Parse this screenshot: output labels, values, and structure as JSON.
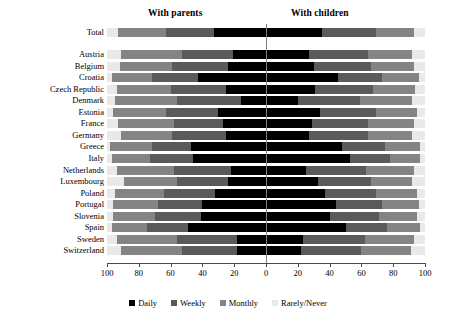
{
  "headers": {
    "left": "With parents",
    "right": "With children"
  },
  "legend": {
    "items": [
      {
        "label": "Daily",
        "color": "#000000"
      },
      {
        "label": "Weekly",
        "color": "#5a5a5a"
      },
      {
        "label": "Monthly",
        "color": "#848484"
      },
      {
        "label": "Rarely/Never",
        "color": "#e9e9e9"
      }
    ]
  },
  "axis": {
    "ticks": [
      "100",
      "80",
      "60",
      "40",
      "20",
      "0",
      "20",
      "40",
      "60",
      "80",
      "100"
    ],
    "tick_values": [
      -100,
      -80,
      -60,
      -40,
      -20,
      0,
      20,
      40,
      60,
      80,
      100
    ],
    "min": -100,
    "max": 100
  },
  "chart_data": {
    "type": "bar",
    "orientation": "horizontal",
    "style": "diverging-stacked",
    "title": "",
    "subtitle": "",
    "xlabel": "",
    "ylabel": "",
    "xlim": [
      -100,
      100
    ],
    "grid": false,
    "legend_position": "bottom",
    "panel_left_label": "With parents",
    "panel_right_label": "With children",
    "series_names": [
      "Daily",
      "Weekly",
      "Monthly",
      "Rarely/Never"
    ],
    "series_colors": [
      "#000000",
      "#5a5a5a",
      "#848484",
      "#e9e9e9"
    ],
    "categories": [
      "Total",
      "Austria",
      "Belgium",
      "Croatia",
      "Czech Republic",
      "Denmark",
      "Estonia",
      "France",
      "Germany",
      "Greece",
      "Italy",
      "Netherlands",
      "Luxembourg",
      "Poland",
      "Portugal",
      "Slovenia",
      "Spain",
      "Sweden",
      "Switzerland"
    ],
    "note": "Values are percentages. Left side = contact with parents, right side = contact with children. Each side sums to 100.",
    "left_values": [
      {
        "category": "Total",
        "Daily": 33,
        "Weekly": 30,
        "Monthly": 30,
        "RarelyNever": 7
      },
      {
        "category": "Austria",
        "Daily": 21,
        "Weekly": 32,
        "Monthly": 38,
        "RarelyNever": 9
      },
      {
        "category": "Belgium",
        "Daily": 24,
        "Weekly": 35,
        "Monthly": 33,
        "RarelyNever": 8
      },
      {
        "category": "Croatia",
        "Daily": 43,
        "Weekly": 29,
        "Monthly": 25,
        "RarelyNever": 3
      },
      {
        "category": "Czech Republic",
        "Daily": 25,
        "Weekly": 35,
        "Monthly": 34,
        "RarelyNever": 6
      },
      {
        "category": "Denmark",
        "Daily": 16,
        "Weekly": 40,
        "Monthly": 39,
        "RarelyNever": 5
      },
      {
        "category": "Estonia",
        "Daily": 30,
        "Weekly": 33,
        "Monthly": 33,
        "RarelyNever": 4
      },
      {
        "category": "France",
        "Daily": 27,
        "Weekly": 31,
        "Monthly": 35,
        "RarelyNever": 7
      },
      {
        "category": "Germany",
        "Daily": 25,
        "Weekly": 34,
        "Monthly": 32,
        "RarelyNever": 9
      },
      {
        "category": "Greece",
        "Daily": 47,
        "Weekly": 25,
        "Monthly": 26,
        "RarelyNever": 2
      },
      {
        "category": "Italy",
        "Daily": 46,
        "Weekly": 27,
        "Monthly": 24,
        "RarelyNever": 3
      },
      {
        "category": "Netherlands",
        "Daily": 22,
        "Weekly": 36,
        "Monthly": 36,
        "RarelyNever": 6
      },
      {
        "category": "Luxembourg",
        "Daily": 24,
        "Weekly": 32,
        "Monthly": 33,
        "RarelyNever": 11
      },
      {
        "category": "Poland",
        "Daily": 32,
        "Weekly": 32,
        "Monthly": 31,
        "RarelyNever": 5
      },
      {
        "category": "Portugal",
        "Daily": 40,
        "Weekly": 28,
        "Monthly": 28,
        "RarelyNever": 4
      },
      {
        "category": "Slovenia",
        "Daily": 41,
        "Weekly": 29,
        "Monthly": 26,
        "RarelyNever": 4
      },
      {
        "category": "Spain",
        "Daily": 49,
        "Weekly": 26,
        "Monthly": 22,
        "RarelyNever": 3
      },
      {
        "category": "Sweden",
        "Daily": 18,
        "Weekly": 38,
        "Monthly": 38,
        "RarelyNever": 6
      },
      {
        "category": "Switzerland",
        "Daily": 18,
        "Weekly": 35,
        "Monthly": 38,
        "RarelyNever": 9
      }
    ],
    "right_values": [
      {
        "category": "Total",
        "Daily": 35,
        "Weekly": 34,
        "Monthly": 24,
        "RarelyNever": 7
      },
      {
        "category": "Austria",
        "Daily": 27,
        "Weekly": 37,
        "Monthly": 28,
        "RarelyNever": 8
      },
      {
        "category": "Belgium",
        "Daily": 30,
        "Weekly": 36,
        "Monthly": 27,
        "RarelyNever": 7
      },
      {
        "category": "Croatia",
        "Daily": 45,
        "Weekly": 28,
        "Monthly": 23,
        "RarelyNever": 4
      },
      {
        "category": "Czech Republic",
        "Daily": 31,
        "Weekly": 36,
        "Monthly": 27,
        "RarelyNever": 6
      },
      {
        "category": "Denmark",
        "Daily": 20,
        "Weekly": 39,
        "Monthly": 33,
        "RarelyNever": 8
      },
      {
        "category": "Estonia",
        "Daily": 34,
        "Weekly": 35,
        "Monthly": 26,
        "RarelyNever": 5
      },
      {
        "category": "France",
        "Daily": 29,
        "Weekly": 35,
        "Monthly": 29,
        "RarelyNever": 7
      },
      {
        "category": "Germany",
        "Daily": 27,
        "Weekly": 37,
        "Monthly": 28,
        "RarelyNever": 8
      },
      {
        "category": "Greece",
        "Daily": 48,
        "Weekly": 27,
        "Monthly": 22,
        "RarelyNever": 3
      },
      {
        "category": "Italy",
        "Daily": 53,
        "Weekly": 25,
        "Monthly": 19,
        "RarelyNever": 3
      },
      {
        "category": "Netherlands",
        "Daily": 25,
        "Weekly": 38,
        "Monthly": 30,
        "RarelyNever": 7
      },
      {
        "category": "Luxembourg",
        "Daily": 33,
        "Weekly": 33,
        "Monthly": 26,
        "RarelyNever": 8
      },
      {
        "category": "Poland",
        "Daily": 37,
        "Weekly": 32,
        "Monthly": 26,
        "RarelyNever": 5
      },
      {
        "category": "Portugal",
        "Daily": 44,
        "Weekly": 29,
        "Monthly": 23,
        "RarelyNever": 4
      },
      {
        "category": "Slovenia",
        "Daily": 40,
        "Weekly": 31,
        "Monthly": 24,
        "RarelyNever": 5
      },
      {
        "category": "Spain",
        "Daily": 50,
        "Weekly": 26,
        "Monthly": 21,
        "RarelyNever": 3
      },
      {
        "category": "Sweden",
        "Daily": 23,
        "Weekly": 39,
        "Monthly": 31,
        "RarelyNever": 7
      },
      {
        "category": "Switzerland",
        "Daily": 22,
        "Weekly": 38,
        "Monthly": 31,
        "RarelyNever": 9
      }
    ]
  }
}
